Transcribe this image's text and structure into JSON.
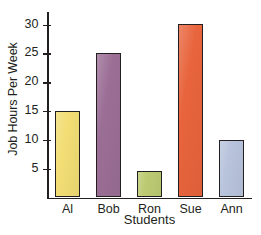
{
  "chart_data": {
    "type": "bar",
    "title": "",
    "xlabel": "Students",
    "ylabel": "Job Hours Per Week",
    "categories": [
      "Al",
      "Bob",
      "Ron",
      "Sue",
      "Ann"
    ],
    "values": [
      15,
      25,
      4.5,
      30,
      10
    ],
    "ylim": [
      0,
      32
    ],
    "yticks": [
      5,
      10,
      15,
      20,
      25,
      30
    ],
    "ytick_labels": [
      "5",
      "10",
      "15",
      "20",
      "25",
      "30"
    ],
    "grid": false,
    "legend": false,
    "bar_colors": [
      "#F2DE74",
      "#9B6E96",
      "#BCCB72",
      "#E8643C",
      "#B8C4DC"
    ],
    "bar_outline_color": "#231F20",
    "axis_color": "#231F20",
    "background": "#FFFFFF"
  }
}
